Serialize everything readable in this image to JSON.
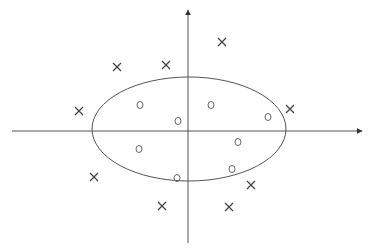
{
  "diagram": {
    "title": "",
    "colors": {
      "axis": "#555555",
      "boundary": "#555555",
      "circle": "#666666",
      "cross": "#444444"
    },
    "axes": {
      "x": {
        "x1": 12,
        "x2": 362,
        "y": 131
      },
      "y": {
        "x": 188,
        "y1": 243,
        "y2": 10
      }
    },
    "boundary": {
      "shape": "ellipse",
      "cx": 189,
      "cy": 129,
      "rx": 97,
      "ry": 52
    },
    "circles": [
      {
        "x": 140,
        "y": 105
      },
      {
        "x": 178,
        "y": 121
      },
      {
        "x": 211,
        "y": 105
      },
      {
        "x": 268,
        "y": 117
      },
      {
        "x": 139,
        "y": 149
      },
      {
        "x": 238,
        "y": 142
      },
      {
        "x": 232,
        "y": 169
      },
      {
        "x": 177,
        "y": 178
      }
    ],
    "crosses": [
      {
        "x": 117,
        "y": 67
      },
      {
        "x": 166,
        "y": 65
      },
      {
        "x": 222,
        "y": 42
      },
      {
        "x": 79,
        "y": 111
      },
      {
        "x": 290,
        "y": 109
      },
      {
        "x": 94,
        "y": 177
      },
      {
        "x": 251,
        "y": 185
      },
      {
        "x": 162,
        "y": 206
      },
      {
        "x": 229,
        "y": 207
      }
    ]
  }
}
